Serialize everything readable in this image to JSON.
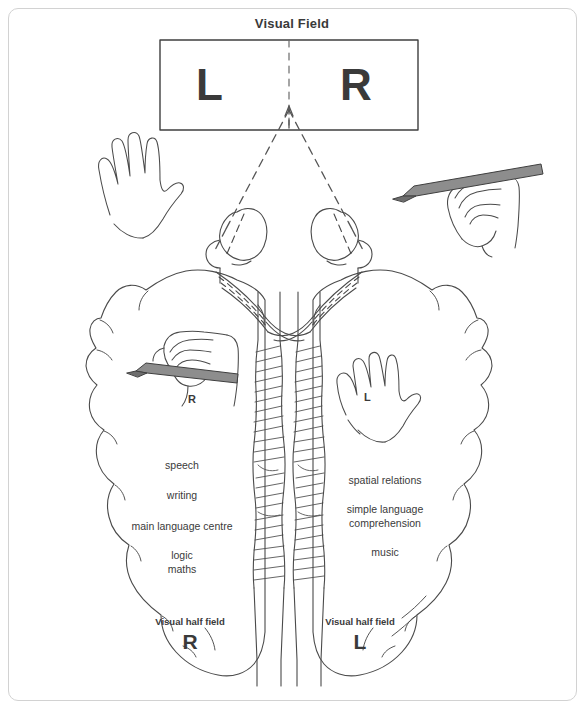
{
  "diagram": {
    "title": "Visual Field",
    "visual_field_box": {
      "left_label": "L",
      "right_label": "R"
    },
    "hemispheres": {
      "left": {
        "hand_label": "R",
        "functions": [
          "speech",
          "writing",
          "main language centre",
          "logic",
          "maths"
        ],
        "visual_half_field_caption": "Visual half field",
        "visual_half_field_letter": "R"
      },
      "right": {
        "hand_label": "L",
        "functions": [
          "spatial relations",
          "simple language",
          "comprehension",
          "music"
        ],
        "visual_half_field_caption": "Visual half field",
        "visual_half_field_letter": "L"
      }
    },
    "colors": {
      "ink": "#3a3a3a",
      "line": "#4a4a4a",
      "border": "#d2d2d2",
      "pencil": "#8a8a8a"
    }
  }
}
